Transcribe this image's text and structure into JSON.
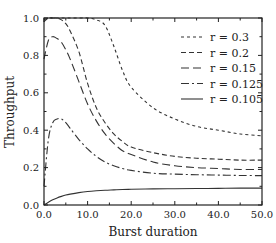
{
  "chart_data": {
    "type": "line",
    "title": "",
    "xlabel": "Burst duration",
    "ylabel": "Throughput",
    "xlim": [
      0,
      50
    ],
    "ylim": [
      0,
      1.0
    ],
    "xticks": [
      "0.0",
      "10.0",
      "20.0",
      "30.0",
      "40.0",
      "50.0"
    ],
    "yticks": [
      "0.0",
      "0.2",
      "0.4",
      "0.6",
      "0.8",
      "1.0"
    ],
    "grid": false,
    "legend_position": "upper right",
    "x": [
      0,
      1,
      2,
      3,
      4,
      5,
      6,
      8,
      10,
      12,
      14,
      16,
      18,
      20,
      25,
      30,
      35,
      40,
      45,
      50
    ],
    "series": [
      {
        "name": "r = 0.3",
        "dash": "3,3",
        "values": [
          0.99,
          1.0,
          1.0,
          1.0,
          1.0,
          1.0,
          1.0,
          1.0,
          1.0,
          0.99,
          0.96,
          0.85,
          0.72,
          0.63,
          0.52,
          0.46,
          0.42,
          0.4,
          0.38,
          0.37
        ]
      },
      {
        "name": "r = 0.2",
        "dash": "5,3",
        "values": [
          0.98,
          1.0,
          1.0,
          1.0,
          0.99,
          0.97,
          0.93,
          0.82,
          0.65,
          0.52,
          0.44,
          0.38,
          0.34,
          0.31,
          0.28,
          0.26,
          0.25,
          0.245,
          0.24,
          0.24
        ]
      },
      {
        "name": "r = 0.15",
        "dash": "8,4",
        "values": [
          0.78,
          0.88,
          0.9,
          0.89,
          0.87,
          0.83,
          0.78,
          0.66,
          0.54,
          0.45,
          0.38,
          0.33,
          0.29,
          0.27,
          0.23,
          0.21,
          0.2,
          0.195,
          0.19,
          0.19
        ]
      },
      {
        "name": "r = 0.125",
        "dash": "8,3,2,3",
        "values": [
          0.1,
          0.35,
          0.44,
          0.46,
          0.46,
          0.44,
          0.41,
          0.35,
          0.3,
          0.26,
          0.23,
          0.21,
          0.195,
          0.185,
          0.17,
          0.165,
          0.162,
          0.16,
          0.158,
          0.157
        ]
      },
      {
        "name": "r = 0.105",
        "dash": "",
        "values": [
          0.0,
          0.015,
          0.028,
          0.038,
          0.046,
          0.053,
          0.058,
          0.066,
          0.072,
          0.076,
          0.079,
          0.081,
          0.083,
          0.084,
          0.086,
          0.087,
          0.088,
          0.089,
          0.09,
          0.09
        ]
      }
    ]
  },
  "colors": {
    "line": "#333333",
    "axis": "#222222",
    "background": "#ffffff"
  }
}
